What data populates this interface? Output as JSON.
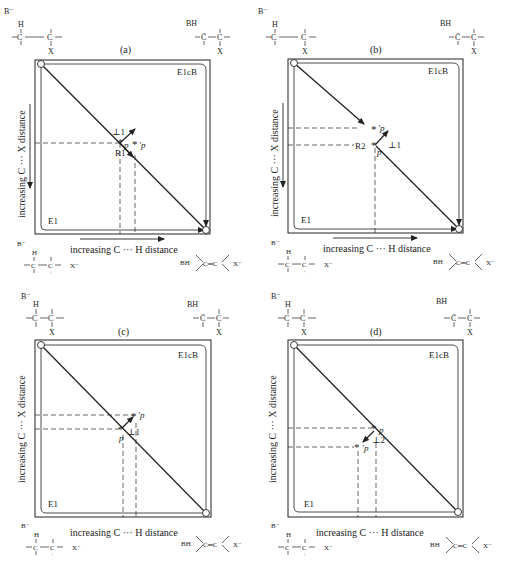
{
  "axes": {
    "x_label": "increasing C ··· H distance",
    "y_label": "increasing C ··· X distance"
  },
  "corners": {
    "top_left": {
      "base": "B⁻",
      "h": "H",
      "c_beta": "C",
      "beta": "β",
      "c_alpha": "C",
      "alpha": "α",
      "x": "X"
    },
    "top_right": {
      "base": "BH",
      "c1": "C̄",
      "c2": "C",
      "x": "X"
    },
    "bottom_left": {
      "base": "B⁻",
      "h": "H",
      "c1": "C",
      "c2": "C",
      "plus": "+",
      "x_ion": "X⁻"
    },
    "bottom_right": {
      "base": "BH",
      "alkene": "C═C",
      "c1": "C",
      "c2": "C",
      "x_ion": "X⁻"
    }
  },
  "regions": {
    "e1cb": "E1cB",
    "e1": "E1"
  },
  "panels": [
    {
      "id": "a",
      "label": "(a)",
      "ts": "p",
      "ts_new": "'p",
      "perp": "⊥1",
      "para": "R1"
    },
    {
      "id": "b",
      "label": "(b)",
      "ts": "p",
      "ts_new": "'p",
      "perp": "⊥1",
      "para": "R2"
    },
    {
      "id": "c",
      "label": "(c)",
      "ts": "p",
      "ts_new": "'p",
      "perp": "⊥1"
    },
    {
      "id": "d",
      "label": "(d)",
      "ts": "p",
      "ts_new": "'p",
      "perp": "⊥2"
    }
  ],
  "colors": {
    "ink": "#222222",
    "background": "#ffffff"
  }
}
